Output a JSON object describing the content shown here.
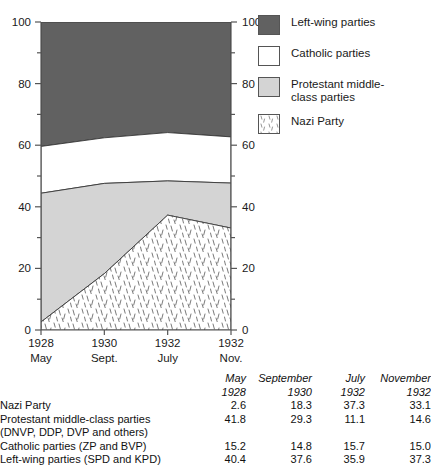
{
  "chart_data": {
    "type": "area",
    "title": "",
    "subtitle": "",
    "xlabel": "",
    "ylabel": "",
    "ylim": [
      0,
      100
    ],
    "grid": false,
    "stacked": true,
    "legend_position": "right",
    "x": [
      "1928 May",
      "1930 Sept.",
      "1932 July",
      "1932 Nov."
    ],
    "x_tick_top": [
      "1928",
      "1930",
      "1932",
      "1932"
    ],
    "x_tick_bottom": [
      "May",
      "Sept.",
      "July",
      "Nov."
    ],
    "y_ticks_labeled": [
      0,
      20,
      40,
      60,
      80,
      100
    ],
    "y_ticks_minor": [
      10,
      30,
      50,
      70,
      90
    ],
    "axis_left_labels": [
      "0",
      "20",
      "40",
      "60",
      "80",
      "100"
    ],
    "axis_right_labels": [
      "0",
      "20",
      "40",
      "60",
      "80",
      "100"
    ],
    "stack_order_bottom_to_top": [
      "Nazi Party",
      "Protestant middle-class parties",
      "Catholic parties",
      "Left-wing parties"
    ],
    "series": [
      {
        "name": "Nazi Party",
        "values": [
          2.6,
          18.3,
          37.3,
          33.1
        ],
        "fill": "hatch",
        "color": "#ffffff"
      },
      {
        "name": "Protestant middle-class parties",
        "values": [
          41.8,
          29.3,
          11.1,
          14.6
        ],
        "fill": "solid",
        "color": "#d4d4d4"
      },
      {
        "name": "Catholic parties",
        "values": [
          15.2,
          14.8,
          15.7,
          15.0
        ],
        "fill": "solid",
        "color": "#ffffff"
      },
      {
        "name": "Left-wing parties",
        "values": [
          40.4,
          37.6,
          35.9,
          37.3
        ],
        "fill": "solid",
        "color": "#616161"
      }
    ]
  },
  "legend": {
    "items": [
      {
        "label": "Left-wing parties",
        "swatch": "dark-gray",
        "color": "#616161"
      },
      {
        "label": "Catholic parties",
        "swatch": "white",
        "color": "#ffffff"
      },
      {
        "label": "Protestant middle-\nclass parties",
        "swatch": "light-gray",
        "color": "#d4d4d4"
      },
      {
        "label": "Nazi Party",
        "swatch": "hatched",
        "color": "#ffffff"
      }
    ]
  },
  "table": {
    "header_month": [
      "May",
      "September",
      "July",
      "November"
    ],
    "header_year": [
      "1928",
      "1930",
      "1932",
      "1932"
    ],
    "rows": [
      {
        "name": "Nazi Party",
        "subname": "",
        "values": [
          "2.6",
          "18.3",
          "37.3",
          "33.1"
        ]
      },
      {
        "name": "Protestant middle-class parties",
        "subname": "(DNVP, DDP, DVP and others)",
        "values": [
          "41.8",
          "29.3",
          "11.1",
          "14.6"
        ]
      },
      {
        "name": "Catholic parties (ZP and BVP)",
        "subname": "",
        "values": [
          "15.2",
          "14.8",
          "15.7",
          "15.0"
        ]
      },
      {
        "name": "Left-wing parties (SPD and KPD)",
        "subname": "",
        "values": [
          "40.4",
          "37.6",
          "35.9",
          "37.3"
        ]
      }
    ]
  },
  "colors": {
    "dark_gray": "#616161",
    "light_gray": "#d4d4d4",
    "white": "#ffffff",
    "axis": "#555555",
    "text": "#1a1a1a"
  }
}
